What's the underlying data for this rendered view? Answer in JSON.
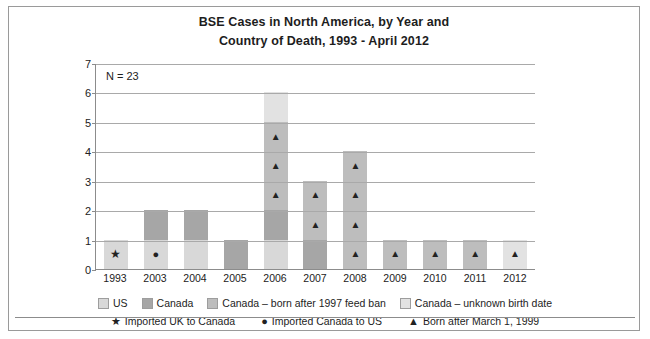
{
  "chart_data": {
    "type": "bar",
    "title": "BSE Cases in North America, by Year and Country of Death, 1993 - April 2012",
    "title_lines": [
      "BSE Cases in North America, by Year and",
      "Country of Death, 1993 - April 2012"
    ],
    "annotation": "N = 23",
    "xlabel": "",
    "ylabel": "",
    "ylim": [
      0,
      7
    ],
    "yticks": [
      0,
      1,
      2,
      3,
      4,
      5,
      6,
      7
    ],
    "grid": true,
    "legend_position": "bottom",
    "stacked": true,
    "categories": [
      "1993",
      "2003",
      "2004",
      "2005",
      "2006",
      "2007",
      "2008",
      "2009",
      "2010",
      "2011",
      "2012"
    ],
    "totals": [
      1,
      2,
      2,
      1,
      6,
      3,
      4,
      1,
      1,
      1,
      1
    ],
    "series": [
      {
        "name": "US",
        "key": "us",
        "color": "#d8d8d8",
        "values": [
          1,
          1,
          1,
          0,
          1,
          0,
          0,
          0,
          0,
          0,
          0
        ]
      },
      {
        "name": "Canada",
        "key": "canada",
        "color": "#a6a6a6",
        "values": [
          0,
          1,
          1,
          1,
          1,
          1,
          0,
          0,
          0,
          0,
          0
        ]
      },
      {
        "name": "Canada – born after 1997 feed ban",
        "key": "feedban",
        "color": "#bdbdbd",
        "values": [
          0,
          0,
          0,
          0,
          3,
          2,
          4,
          1,
          1,
          1,
          0
        ]
      },
      {
        "name": "Canada – unknown birth date",
        "key": "unknown",
        "color": "#e2e2e2",
        "values": [
          0,
          0,
          0,
          0,
          1,
          0,
          0,
          0,
          0,
          0,
          1
        ]
      }
    ],
    "stacks": [
      {
        "year": "1993",
        "total": 1,
        "segments": [
          {
            "series": "us",
            "value": 1,
            "marker": "star"
          }
        ]
      },
      {
        "year": "2003",
        "total": 2,
        "segments": [
          {
            "series": "us",
            "value": 1,
            "marker": "circle"
          },
          {
            "series": "canada",
            "value": 1,
            "marker": ""
          }
        ]
      },
      {
        "year": "2004",
        "total": 2,
        "segments": [
          {
            "series": "us",
            "value": 1,
            "marker": ""
          },
          {
            "series": "canada",
            "value": 1,
            "marker": ""
          }
        ]
      },
      {
        "year": "2005",
        "total": 1,
        "segments": [
          {
            "series": "canada",
            "value": 1,
            "marker": ""
          }
        ]
      },
      {
        "year": "2006",
        "total": 6,
        "segments": [
          {
            "series": "us",
            "value": 1,
            "marker": ""
          },
          {
            "series": "canada",
            "value": 1,
            "marker": ""
          },
          {
            "series": "feedban",
            "value": 1,
            "marker": "triangle"
          },
          {
            "series": "feedban",
            "value": 1,
            "marker": "triangle"
          },
          {
            "series": "feedban",
            "value": 1,
            "marker": "triangle"
          },
          {
            "series": "unknown",
            "value": 1,
            "marker": ""
          }
        ]
      },
      {
        "year": "2007",
        "total": 3,
        "segments": [
          {
            "series": "canada",
            "value": 1,
            "marker": ""
          },
          {
            "series": "feedban",
            "value": 1,
            "marker": "triangle"
          },
          {
            "series": "feedban",
            "value": 1,
            "marker": "triangle"
          }
        ]
      },
      {
        "year": "2008",
        "total": 4,
        "segments": [
          {
            "series": "feedban",
            "value": 1,
            "marker": "triangle"
          },
          {
            "series": "feedban",
            "value": 1,
            "marker": "triangle"
          },
          {
            "series": "feedban",
            "value": 1,
            "marker": "triangle"
          },
          {
            "series": "feedban",
            "value": 1,
            "marker": "triangle"
          }
        ]
      },
      {
        "year": "2009",
        "total": 1,
        "segments": [
          {
            "series": "feedban",
            "value": 1,
            "marker": "triangle"
          }
        ]
      },
      {
        "year": "2010",
        "total": 1,
        "segments": [
          {
            "series": "feedban",
            "value": 1,
            "marker": "triangle"
          }
        ]
      },
      {
        "year": "2011",
        "total": 1,
        "segments": [
          {
            "series": "feedban",
            "value": 1,
            "marker": "triangle"
          }
        ]
      },
      {
        "year": "2012",
        "total": 1,
        "segments": [
          {
            "series": "unknown",
            "value": 1,
            "marker": "triangle"
          }
        ]
      }
    ],
    "legend_swatches": [
      {
        "label": "US",
        "color": "#d8d8d8"
      },
      {
        "label": "Canada",
        "color": "#a6a6a6"
      },
      {
        "label": "Canada – born after 1997 feed ban",
        "color": "#bdbdbd"
      },
      {
        "label": "Canada – unknown birth date",
        "color": "#e2e2e2"
      }
    ],
    "legend_markers": [
      {
        "glyph": "★",
        "label": "Imported UK to Canada",
        "name": "star"
      },
      {
        "glyph": "●",
        "label": "Imported Canada to US",
        "name": "circle"
      },
      {
        "glyph": "▲",
        "label": "Born after March 1, 1999",
        "name": "triangle"
      }
    ]
  },
  "colors": {
    "frame": "#9a9a9a",
    "axis": "#8c8c8c",
    "grid": "#a9a9a9",
    "text": "#1d1d1d",
    "marker": "#222222"
  }
}
